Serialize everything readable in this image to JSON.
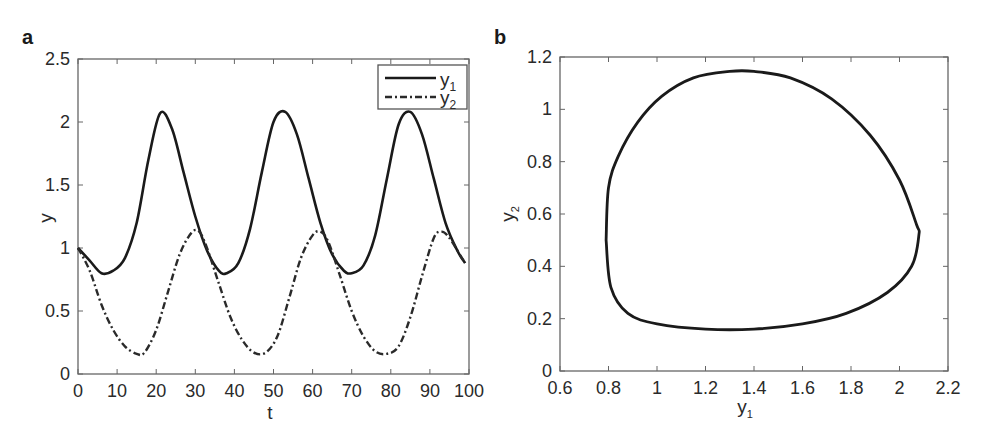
{
  "chart_data": [
    {
      "panel": "a",
      "type": "line",
      "title": "",
      "xlabel": "t",
      "ylabel": "y",
      "xlim": [
        0,
        100
      ],
      "ylim": [
        0,
        2.5
      ],
      "xticks": [
        "0",
        "10",
        "20",
        "30",
        "40",
        "50",
        "60",
        "70",
        "80",
        "90",
        "100"
      ],
      "yticks": [
        "0",
        "0.5",
        "1",
        "1.5",
        "2",
        "2.5"
      ],
      "legend": {
        "position": "upper right",
        "entries": [
          "y1",
          "y2"
        ]
      },
      "grid": false,
      "series": [
        {
          "name": "y1",
          "style": "solid",
          "x": [
            0,
            3,
            6,
            9,
            12,
            15,
            18,
            21,
            24,
            27,
            30,
            33,
            36,
            38,
            41,
            44,
            47,
            50,
            53,
            56,
            59,
            62,
            65,
            68,
            70,
            73,
            76,
            79,
            82,
            85,
            88,
            91,
            94,
            97,
            99
          ],
          "values": [
            1.0,
            0.9,
            0.8,
            0.82,
            0.92,
            1.2,
            1.7,
            2.07,
            1.95,
            1.6,
            1.25,
            0.98,
            0.82,
            0.8,
            0.88,
            1.15,
            1.6,
            2.0,
            2.08,
            1.9,
            1.55,
            1.2,
            0.95,
            0.82,
            0.8,
            0.86,
            1.1,
            1.55,
            1.98,
            2.08,
            1.9,
            1.55,
            1.2,
            0.98,
            0.88
          ]
        },
        {
          "name": "y2",
          "style": "dash-dot",
          "x": [
            0,
            3,
            6,
            9,
            12,
            15,
            17,
            20,
            23,
            26,
            29,
            31,
            33,
            36,
            39,
            42,
            45,
            48,
            51,
            54,
            57,
            60,
            62,
            64,
            67,
            70,
            73,
            76,
            79,
            82,
            85,
            88,
            91,
            93,
            95,
            98,
            99
          ],
          "values": [
            1.0,
            0.82,
            0.55,
            0.35,
            0.22,
            0.16,
            0.17,
            0.35,
            0.65,
            0.95,
            1.12,
            1.13,
            1.0,
            0.72,
            0.45,
            0.27,
            0.17,
            0.17,
            0.3,
            0.6,
            0.92,
            1.1,
            1.13,
            1.05,
            0.78,
            0.5,
            0.3,
            0.18,
            0.16,
            0.22,
            0.45,
            0.78,
            1.08,
            1.13,
            1.08,
            0.93,
            0.88
          ]
        }
      ]
    },
    {
      "panel": "b",
      "type": "line",
      "title": "",
      "xlabel": "y1",
      "ylabel": "y2",
      "xlim": [
        0.6,
        2.2
      ],
      "ylim": [
        0,
        1.2
      ],
      "xticks": [
        "0.6",
        "0.8",
        "1",
        "1.2",
        "1.4",
        "1.6",
        "1.8",
        "2",
        "2.2"
      ],
      "yticks": [
        "0",
        "0.2",
        "0.4",
        "0.6",
        "0.8",
        "1",
        "1.2"
      ],
      "grid": false,
      "series": [
        {
          "name": "phase portrait (y1, y2)",
          "style": "solid",
          "x": [
            0.79,
            0.8,
            0.84,
            0.92,
            1.02,
            1.15,
            1.3,
            1.4,
            1.55,
            1.72,
            1.88,
            2.0,
            2.07,
            2.08,
            2.05,
            1.95,
            1.78,
            1.6,
            1.4,
            1.2,
            1.0,
            0.88,
            0.81,
            0.79
          ],
          "values": [
            0.5,
            0.7,
            0.82,
            0.95,
            1.05,
            1.12,
            1.145,
            1.145,
            1.12,
            1.04,
            0.9,
            0.73,
            0.56,
            0.52,
            0.4,
            0.3,
            0.22,
            0.18,
            0.16,
            0.16,
            0.18,
            0.22,
            0.32,
            0.5
          ]
        }
      ]
    }
  ],
  "panels": {
    "a": {
      "label": "a",
      "xlabel": "t",
      "ylabel": "y",
      "legend": [
        {
          "text": "y",
          "sub": "1"
        },
        {
          "text": "y",
          "sub": "2"
        }
      ]
    },
    "b": {
      "label": "b",
      "xlabel": "y",
      "xlabel_sub": "1",
      "ylabel": "y",
      "ylabel_sub": "2"
    }
  }
}
